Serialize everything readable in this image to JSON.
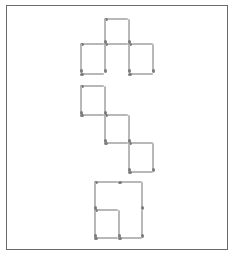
{
  "puzzle": {
    "title": "",
    "colors": {
      "stick": "#b8b8b8",
      "head": "#7a7a7a",
      "frame": "#6a6a6a",
      "background": "#ffffff"
    },
    "figures": [
      {
        "name": "top-figure",
        "sticks": [
          {
            "o": "h",
            "x": 105,
            "y": 18,
            "len": 23
          },
          {
            "o": "v",
            "x": 104,
            "y": 19,
            "len": 24
          },
          {
            "o": "v",
            "x": 128,
            "y": 19,
            "len": 24
          },
          {
            "o": "h",
            "x": 81,
            "y": 43,
            "len": 23
          },
          {
            "o": "h",
            "x": 105,
            "y": 43,
            "len": 23
          },
          {
            "o": "h",
            "x": 129,
            "y": 43,
            "len": 24
          },
          {
            "o": "v",
            "x": 80,
            "y": 44,
            "len": 28
          },
          {
            "o": "v",
            "x": 104,
            "y": 44,
            "len": 28
          },
          {
            "o": "v",
            "x": 128,
            "y": 44,
            "len": 28
          },
          {
            "o": "v",
            "x": 152,
            "y": 44,
            "len": 28
          },
          {
            "o": "h",
            "x": 81,
            "y": 73,
            "len": 23
          },
          {
            "o": "h",
            "x": 129,
            "y": 73,
            "len": 24
          }
        ]
      },
      {
        "name": "middle-figure",
        "sticks": [
          {
            "o": "h",
            "x": 81,
            "y": 85,
            "len": 23
          },
          {
            "o": "v",
            "x": 80,
            "y": 86,
            "len": 28
          },
          {
            "o": "v",
            "x": 104,
            "y": 86,
            "len": 28
          },
          {
            "o": "h",
            "x": 81,
            "y": 114,
            "len": 23
          },
          {
            "o": "h",
            "x": 105,
            "y": 114,
            "len": 23
          },
          {
            "o": "v",
            "x": 104,
            "y": 115,
            "len": 27
          },
          {
            "o": "v",
            "x": 128,
            "y": 115,
            "len": 27
          },
          {
            "o": "h",
            "x": 105,
            "y": 142,
            "len": 23
          },
          {
            "o": "h",
            "x": 129,
            "y": 142,
            "len": 24
          },
          {
            "o": "v",
            "x": 128,
            "y": 143,
            "len": 28
          },
          {
            "o": "v",
            "x": 152,
            "y": 143,
            "len": 28
          },
          {
            "o": "h",
            "x": 129,
            "y": 171,
            "len": 24
          }
        ]
      },
      {
        "name": "bottom-figure",
        "sticks": [
          {
            "o": "h",
            "x": 95,
            "y": 181,
            "len": 23
          },
          {
            "o": "h",
            "x": 119,
            "y": 181,
            "len": 23
          },
          {
            "o": "v",
            "x": 94,
            "y": 182,
            "len": 27
          },
          {
            "o": "v",
            "x": 141,
            "y": 182,
            "len": 27
          },
          {
            "o": "h",
            "x": 95,
            "y": 209,
            "len": 23
          },
          {
            "o": "v",
            "x": 94,
            "y": 210,
            "len": 27
          },
          {
            "o": "v",
            "x": 118,
            "y": 210,
            "len": 27
          },
          {
            "o": "v",
            "x": 141,
            "y": 210,
            "len": 27
          },
          {
            "o": "h",
            "x": 95,
            "y": 237,
            "len": 23
          },
          {
            "o": "h",
            "x": 119,
            "y": 237,
            "len": 23
          }
        ]
      }
    ]
  }
}
